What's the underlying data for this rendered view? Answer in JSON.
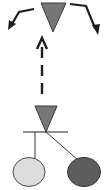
{
  "diagram": {
    "colors": {
      "background": "#ffffff",
      "line": "#1e1e1e",
      "triangle_fill": "#777777",
      "triangle_stroke": "#3a3a3a",
      "ellipse_light": "#dcdcdc",
      "ellipse_dark": "#5c5c5c",
      "ellipse_stroke": "#4a4a4a"
    },
    "nodes": [
      {
        "id": "top-triangle",
        "shape": "inverted-triangle",
        "fill": "gray"
      },
      {
        "id": "lower-triangle",
        "shape": "inverted-triangle",
        "fill": "gray"
      },
      {
        "id": "left-ellipse",
        "shape": "ellipse",
        "fill": "light-gray"
      },
      {
        "id": "right-ellipse",
        "shape": "ellipse",
        "fill": "dark-gray"
      }
    ],
    "edges": [
      {
        "from": "top-triangle",
        "to": "left",
        "style": "solid-arrow"
      },
      {
        "from": "top-triangle",
        "to": "right",
        "style": "solid-arrow"
      },
      {
        "from": "lower-triangle",
        "to": "top-triangle",
        "style": "dashed-arrow"
      },
      {
        "from": "lower-triangle",
        "to": "left-ellipse",
        "style": "solid-line"
      },
      {
        "from": "lower-triangle",
        "to": "right-ellipse",
        "style": "solid-line"
      }
    ]
  }
}
